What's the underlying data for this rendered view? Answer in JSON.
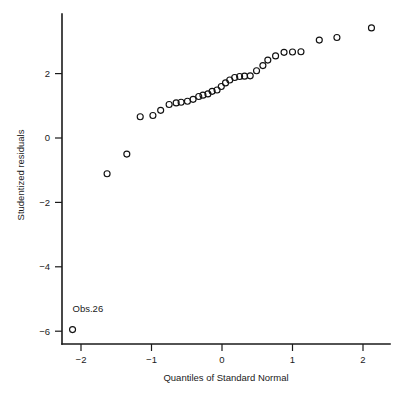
{
  "chart_data": {
    "type": "scatter",
    "title": "",
    "subtitle": "",
    "xlabel": "Quantiles of Standard Normal",
    "ylabel": "Studentized residuals",
    "xlim": [
      -2.35,
      2.45
    ],
    "ylim": [
      -6.45,
      3.75
    ],
    "grid": false,
    "legend": null,
    "xticks": [
      -2,
      -1,
      0,
      1,
      2
    ],
    "xticklabels": [
      "−2",
      "−1",
      "0",
      "1",
      "2"
    ],
    "yticks": [
      2,
      0,
      -2,
      -4,
      -6
    ],
    "yticklabels": [
      "2",
      "0",
      "−2",
      "−4",
      "−6"
    ],
    "marker": "open-circle",
    "marker_radius": 3.0,
    "marker_color": "#111111",
    "n_points": 30,
    "x": [
      -2.12,
      -1.63,
      -1.35,
      -1.16,
      -0.98,
      -0.87,
      -0.75,
      -0.65,
      -0.58,
      -0.49,
      -0.41,
      -0.33,
      -0.27,
      -0.2,
      -0.14,
      -0.07,
      -0.01,
      0.05,
      0.11,
      0.18,
      0.25,
      0.32,
      0.4,
      0.49,
      0.58,
      0.65,
      0.76,
      0.88,
      1.0,
      1.12
    ],
    "y": [
      -5.95,
      -1.11,
      -0.5,
      0.66,
      0.7,
      0.86,
      1.04,
      1.09,
      1.11,
      1.14,
      1.2,
      1.29,
      1.33,
      1.37,
      1.45,
      1.49,
      1.6,
      1.71,
      1.8,
      1.88,
      1.91,
      1.92,
      1.93,
      2.09,
      2.25,
      2.42,
      2.55,
      2.66,
      2.67,
      2.68
    ],
    "x_extra": [
      1.38,
      1.63,
      2.12
    ],
    "y_extra": [
      3.04,
      3.12,
      3.42
    ],
    "annotations": [
      {
        "text": "Obs.26",
        "point_x": -2.12,
        "point_y": -5.95,
        "dx": 0,
        "dy": 0.55
      }
    ]
  },
  "axes": {
    "x_axis_name": "x-axis",
    "y_axis_name": "y-axis"
  }
}
